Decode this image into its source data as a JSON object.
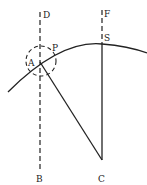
{
  "diagram": {
    "labels": {
      "D": "D",
      "F": "F",
      "S": "S",
      "P": "P",
      "A": "A",
      "B": "B",
      "C": "C"
    },
    "colors": {
      "stroke": "#222222",
      "background": "#ffffff"
    }
  }
}
